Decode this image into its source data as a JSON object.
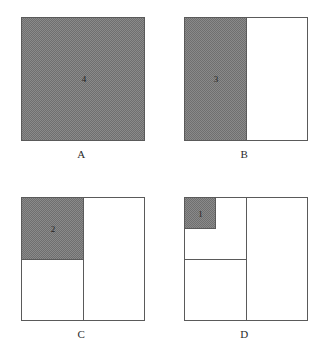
{
  "figure": {
    "shade_color": "#8a8a8a",
    "line_color": "#5a5a5a",
    "background_color": "#ffffff",
    "panels": [
      {
        "caption": "A",
        "number": "4",
        "shaded_fraction": "1",
        "fraction_text": "whole square shaded"
      },
      {
        "caption": "B",
        "number": "3",
        "shaded_fraction": "1/2",
        "fraction_text": "left half shaded"
      },
      {
        "caption": "C",
        "number": "2",
        "shaded_fraction": "1/4",
        "fraction_text": "top-left quarter shaded"
      },
      {
        "caption": "D",
        "number": "1",
        "shaded_fraction": "1/8",
        "fraction_text": "top-left eighth shaded"
      }
    ]
  }
}
